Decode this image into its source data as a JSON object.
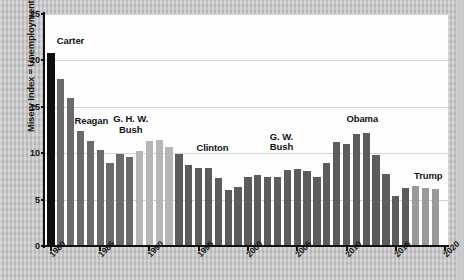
{
  "chart_data": {
    "type": "bar",
    "title": "",
    "xlabel": "",
    "ylabel": "Misery Index = Unemployment Rate + Inflation Rate (%)",
    "ylim": [
      0,
      25
    ],
    "yticks": [
      0,
      5,
      10,
      15,
      20,
      25
    ],
    "ytick_labels": [
      "0",
      "5",
      "10",
      "15",
      "20",
      "25"
    ],
    "xlim": [
      1979.3,
      2020.3
    ],
    "xticks": [
      1980,
      1985,
      1990,
      1995,
      2000,
      2005,
      2010,
      2015,
      2020
    ],
    "xtick_labels": [
      "1980",
      "1985",
      "1990",
      "1995",
      "2000",
      "2005",
      "2010",
      "2015",
      "2020"
    ],
    "grid": "horizontal",
    "legend": "none",
    "categories": [
      "1980",
      "1981",
      "1982",
      "1983",
      "1984",
      "1985",
      "1986",
      "1987",
      "1988",
      "1989",
      "1990",
      "1991",
      "1992",
      "1993",
      "1994",
      "1995",
      "1996",
      "1997",
      "1998",
      "1999",
      "2000",
      "2001",
      "2002",
      "2003",
      "2004",
      "2005",
      "2006",
      "2007",
      "2008",
      "2009",
      "2010",
      "2011",
      "2012",
      "2013",
      "2014",
      "2015",
      "2016",
      "2017",
      "2018",
      "2019"
    ],
    "values": [
      20.8,
      18.0,
      15.9,
      12.4,
      11.3,
      10.3,
      8.9,
      9.9,
      9.6,
      10.2,
      11.3,
      11.4,
      10.7,
      9.9,
      8.7,
      8.4,
      8.4,
      7.3,
      6.0,
      6.4,
      7.4,
      7.6,
      7.4,
      7.4,
      8.2,
      8.3,
      8.1,
      7.4,
      8.9,
      11.2,
      11.0,
      12.1,
      12.2,
      9.8,
      7.8,
      5.4,
      6.2,
      6.5,
      6.3,
      6.1
    ],
    "colors": {
      "carter": "#0e0e0e",
      "reagan": "#6a6a6a",
      "ghw_bush": "#b6b6b6",
      "clinton": "#5c5c5c",
      "gw_bush": "#5c5c5c",
      "obama": "#5c5c5c",
      "trump": "#9a9a9a",
      "gridline": "#d3d3d3",
      "axis": "#111111",
      "plot_background": "#fefefe",
      "page_background": "#c7c7c7"
    },
    "bar_colors": [
      "#0e0e0e",
      "#6a6a6a",
      "#6a6a6a",
      "#6a6a6a",
      "#6a6a6a",
      "#6a6a6a",
      "#6a6a6a",
      "#6a6a6a",
      "#6a6a6a",
      "#b6b6b6",
      "#b6b6b6",
      "#b6b6b6",
      "#b6b6b6",
      "#5c5c5c",
      "#5c5c5c",
      "#5c5c5c",
      "#5c5c5c",
      "#5c5c5c",
      "#5c5c5c",
      "#5c5c5c",
      "#5c5c5c",
      "#5c5c5c",
      "#5c5c5c",
      "#5c5c5c",
      "#5c5c5c",
      "#5c5c5c",
      "#5c5c5c",
      "#5c5c5c",
      "#5c5c5c",
      "#5c5c5c",
      "#5c5c5c",
      "#5c5c5c",
      "#5c5c5c",
      "#5c5c5c",
      "#5c5c5c",
      "#5c5c5c",
      "#5c5c5c",
      "#9a9a9a",
      "#9a9a9a",
      "#9a9a9a"
    ],
    "annotations": [
      {
        "id": "carter",
        "text": "Carter",
        "x": 1980.6,
        "y": 22.6,
        "align": "left"
      },
      {
        "id": "reagan",
        "text": "Reagan",
        "x": 1984.1,
        "y": 14.0,
        "align": "center"
      },
      {
        "id": "ghw-bush",
        "text": "G. H. W.\nBush",
        "x": 1988.1,
        "y": 14.2,
        "align": "center"
      },
      {
        "id": "clinton",
        "text": "Clinton",
        "x": 1996.4,
        "y": 11.1,
        "align": "center"
      },
      {
        "id": "gw-bush",
        "text": "G. W.\nBush",
        "x": 2003.4,
        "y": 12.3,
        "align": "center"
      },
      {
        "id": "obama",
        "text": "Obama",
        "x": 2011.6,
        "y": 14.2,
        "align": "center"
      },
      {
        "id": "trump",
        "text": "Trump",
        "x": 2018.3,
        "y": 8.1,
        "align": "center"
      }
    ]
  }
}
